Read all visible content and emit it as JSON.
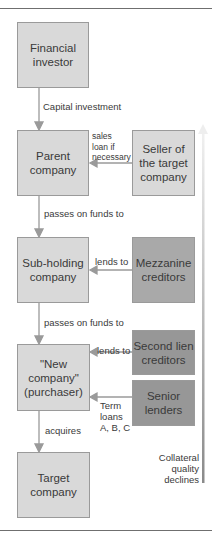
{
  "diagram": {
    "type": "leveraged-buyout-financing-structure",
    "left_column": [
      {
        "id": "financial_investor",
        "label": "Financial\ninvestor"
      },
      {
        "id": "parent_company",
        "label": "Parent\ncompany"
      },
      {
        "id": "sub_holding",
        "label": "Sub-holding\ncompany"
      },
      {
        "id": "new_company",
        "label": "\"New\ncompany\"\n(purchaser)"
      },
      {
        "id": "target_company",
        "label": "Target\ncompany"
      }
    ],
    "right_column": [
      {
        "id": "seller",
        "label": "Seller of\nthe target\ncompany"
      },
      {
        "id": "mezzanine",
        "label": "Mezzanine\ncreditors"
      },
      {
        "id": "second_lien",
        "label": "Second lien\ncreditors"
      },
      {
        "id": "senior_lenders",
        "label": "Senior\nlenders"
      }
    ],
    "edges": {
      "capital_investment": "Capital investment",
      "sales_loan": "sales\nloan if\nnecessary",
      "passes_on_1": "passes on funds to",
      "lends_mezz": "lends to",
      "passes_on_2": "passes on funds to",
      "lends_second": "lends to",
      "term_loans": "Term\nloans\nA, B, C",
      "acquires": "acquires"
    },
    "side_axis": {
      "label": "Collateral\nquality\ndeclines",
      "direction": "up"
    },
    "colors": {
      "light_box": "#d9d9d9",
      "mezzanine_box": "#a9a9a9",
      "lender_box": "#979797",
      "arrow": "#9a9a9a"
    }
  }
}
